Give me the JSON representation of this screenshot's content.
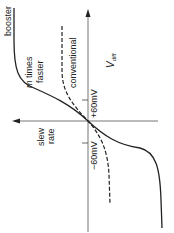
{
  "diagram": {
    "orientation": "rotated 90deg counter-clockwise",
    "axes": {
      "vertical_axis_label": "V",
      "vertical_axis_subscript": "diff",
      "horizontal_axis_label_line1": "slew",
      "horizontal_axis_label_line2": "rate"
    },
    "ticks": {
      "positive": "+60mV",
      "negative": "−60mV"
    },
    "curves": {
      "booster": {
        "label": "booster",
        "style": "solid"
      },
      "conventional": {
        "label": "conventional",
        "style": "dashed"
      }
    },
    "annotation_line1": "m",
    "annotation_line1_rest": " times",
    "annotation_line2": "faster",
    "colors": {
      "line": "#222222",
      "axis": "#555555",
      "background": "#ffffff"
    }
  }
}
